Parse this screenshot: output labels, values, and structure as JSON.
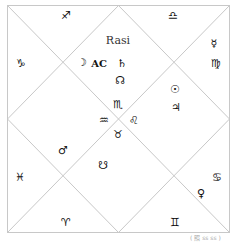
{
  "chart": {
    "title": "Rasi",
    "caption": "( 照 ss ss )",
    "line_color": "#c8c8c8",
    "houses": [
      {
        "house": 1,
        "sign": "♏",
        "sign_name": "scorpio",
        "planets": [
          {
            "symbol": "AC",
            "name": "ascendant"
          },
          {
            "symbol": "♄",
            "name": "saturn"
          },
          {
            "symbol": "☊",
            "name": "rahu"
          }
        ]
      },
      {
        "house": 2,
        "sign": "♐",
        "sign_name": "sagittarius",
        "planets": [
          {
            "symbol": "☽",
            "name": "moon"
          }
        ]
      },
      {
        "house": 3,
        "sign": "♑",
        "sign_name": "capricorn",
        "planets": []
      },
      {
        "house": 4,
        "sign": "♒",
        "sign_name": "aquarius",
        "planets": [
          {
            "symbol": "♂",
            "name": "mars"
          }
        ]
      },
      {
        "house": 5,
        "sign": "♓",
        "sign_name": "pisces",
        "planets": []
      },
      {
        "house": 6,
        "sign": "♈",
        "sign_name": "aries",
        "planets": []
      },
      {
        "house": 7,
        "sign": "♉",
        "sign_name": "taurus",
        "planets": [
          {
            "symbol": "☋",
            "name": "ketu"
          }
        ]
      },
      {
        "house": 8,
        "sign": "♊",
        "sign_name": "gemini",
        "planets": []
      },
      {
        "house": 9,
        "sign": "♋",
        "sign_name": "cancer",
        "planets": [
          {
            "symbol": "♀",
            "name": "venus"
          }
        ]
      },
      {
        "house": 10,
        "sign": "♌",
        "sign_name": "leo",
        "planets": [
          {
            "symbol": "☉",
            "name": "sun"
          },
          {
            "symbol": "♃",
            "name": "jupiter"
          }
        ]
      },
      {
        "house": 11,
        "sign": "♍",
        "sign_name": "virgo",
        "planets": [
          {
            "symbol": "☿",
            "name": "mercury"
          }
        ]
      },
      {
        "house": 12,
        "sign": "♎",
        "sign_name": "libra",
        "planets": []
      }
    ]
  }
}
